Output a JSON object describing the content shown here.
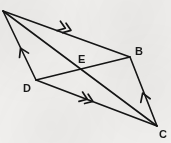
{
  "figure": {
    "kind": "geometry-diagram",
    "width": 171,
    "height": 143,
    "background_color": "#f1f0ee",
    "ink_color": "#151515",
    "stroke_width": 1.6
  },
  "points": {
    "A": {
      "label": "",
      "x": 3,
      "y": 11,
      "visible_label": false
    },
    "B": {
      "label": "B",
      "x": 130,
      "y": 57,
      "label_x": 135,
      "label_y": 46
    },
    "C": {
      "label": "C",
      "x": 157,
      "y": 126,
      "label_x": 159,
      "label_y": 129
    },
    "D": {
      "label": "D",
      "x": 36,
      "y": 80,
      "label_x": 23,
      "label_y": 83
    },
    "E": {
      "label": "E",
      "x": 84,
      "y": 68,
      "label_x": 78,
      "label_y": 54
    }
  },
  "segments": [
    {
      "name": "side-AB",
      "from": "A",
      "to": "B",
      "x1": 3,
      "y1": 11,
      "x2": 130,
      "y2": 57
    },
    {
      "name": "side-DC",
      "from": "D",
      "to": "C",
      "x1": 36,
      "y1": 80,
      "x2": 157,
      "y2": 126
    },
    {
      "name": "side-AD",
      "from": "A",
      "to": "D",
      "x1": 3,
      "y1": 11,
      "x2": 36,
      "y2": 80
    },
    {
      "name": "side-BC",
      "from": "B",
      "to": "C",
      "x1": 130,
      "y1": 57,
      "x2": 157,
      "y2": 126
    },
    {
      "name": "diagonal-AC",
      "from": "A",
      "to": "C",
      "x1": 3,
      "y1": 11,
      "x2": 157,
      "y2": 126
    },
    {
      "name": "diagonal-DB",
      "from": "D",
      "to": "B",
      "x1": 36,
      "y1": 80,
      "x2": 130,
      "y2": 57
    }
  ],
  "tick_marks": [
    {
      "name": "double-arrow-AB",
      "on": "side-AB",
      "x": 70,
      "y": 30,
      "angle_deg": 19.9,
      "count": 2
    },
    {
      "name": "double-arrow-DC",
      "on": "side-DC",
      "x": 92,
      "y": 101,
      "angle_deg": 20.8,
      "count": 2
    },
    {
      "name": "single-arrow-AD",
      "on": "side-AD",
      "x": 21,
      "y": 49,
      "angle_deg": -115.6,
      "count": 1
    },
    {
      "name": "single-arrow-BC",
      "on": "side-BC",
      "x": 143,
      "y": 94,
      "angle_deg": -110.6,
      "count": 1
    }
  ]
}
